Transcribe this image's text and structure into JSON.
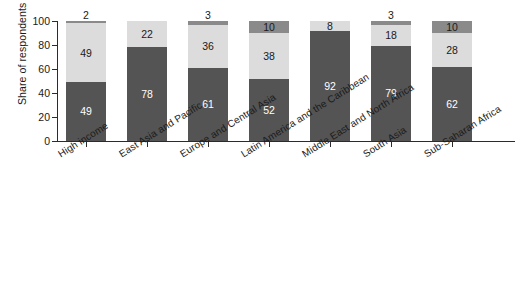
{
  "chart_data": {
    "type": "bar",
    "subtype": "stacked-bar",
    "title": "",
    "xlabel": "",
    "ylabel": "Share of respondents (%)",
    "ylim": [
      0,
      100
    ],
    "yticks": [
      0,
      20,
      40,
      60,
      80,
      100
    ],
    "grid": false,
    "legend": "none",
    "stack_order": "bottom-to-top",
    "categories": [
      "High income",
      "East Asia and Pacific",
      "Europe and Central Asia",
      "Latin America and the Caribbean",
      "Middle East and North Africa",
      "South Asia",
      "Sub-Saharan Africa"
    ],
    "series": [
      {
        "name": "bottom-segment",
        "color": "#545454",
        "values": [
          49,
          78,
          61,
          52,
          92,
          79,
          62
        ]
      },
      {
        "name": "middle-segment",
        "color": "#dcdcdc",
        "values": [
          49,
          22,
          36,
          38,
          8,
          18,
          28
        ]
      },
      {
        "name": "top-segment",
        "color": "#8a8a8a",
        "values": [
          2,
          null,
          3,
          10,
          null,
          3,
          10
        ]
      }
    ]
  },
  "axis": {
    "y_title": "Share of respondents (%)",
    "ticks": [
      "100",
      "80",
      "60",
      "40",
      "20",
      "0"
    ]
  },
  "bars": [
    {
      "category": "High income",
      "bottom": {
        "value": 49,
        "label": "49",
        "label_position": "inside"
      },
      "middle": {
        "value": 49,
        "label": "49",
        "label_position": "inside"
      },
      "top": {
        "value": 2,
        "label": "2",
        "label_position": "outside"
      }
    },
    {
      "category": "East Asia and Pacific",
      "bottom": {
        "value": 78,
        "label": "78",
        "label_position": "inside"
      },
      "middle": {
        "value": 22,
        "label": "22",
        "label_position": "inside"
      },
      "top": {
        "value": 0,
        "label": "",
        "label_position": "none"
      }
    },
    {
      "category": "Europe and Central Asia",
      "bottom": {
        "value": 61,
        "label": "61",
        "label_position": "inside"
      },
      "middle": {
        "value": 36,
        "label": "36",
        "label_position": "inside"
      },
      "top": {
        "value": 3,
        "label": "3",
        "label_position": "outside"
      }
    },
    {
      "category": "Latin America and the Caribbean",
      "bottom": {
        "value": 52,
        "label": "52",
        "label_position": "inside"
      },
      "middle": {
        "value": 38,
        "label": "38",
        "label_position": "inside"
      },
      "top": {
        "value": 10,
        "label": "10",
        "label_position": "inside"
      }
    },
    {
      "category": "Middle East and North Africa",
      "bottom": {
        "value": 92,
        "label": "92",
        "label_position": "inside"
      },
      "middle": {
        "value": 8,
        "label": "8",
        "label_position": "inside"
      },
      "top": {
        "value": 0,
        "label": "",
        "label_position": "none"
      }
    },
    {
      "category": "South Asia",
      "bottom": {
        "value": 79,
        "label": "79",
        "label_position": "inside"
      },
      "middle": {
        "value": 18,
        "label": "18",
        "label_position": "inside"
      },
      "top": {
        "value": 3,
        "label": "3",
        "label_position": "outside"
      }
    },
    {
      "category": "Sub-Saharan Africa",
      "bottom": {
        "value": 62,
        "label": "62",
        "label_position": "inside"
      },
      "middle": {
        "value": 28,
        "label": "28",
        "label_position": "inside"
      },
      "top": {
        "value": 10,
        "label": "10",
        "label_position": "inside"
      }
    }
  ]
}
